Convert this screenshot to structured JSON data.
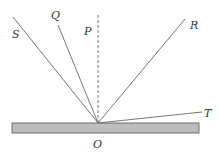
{
  "diagram": {
    "type": "ray-diagram",
    "surface": {
      "x1": 12,
      "y1": 123,
      "x2": 199,
      "y2": 133,
      "fill": "#bdbdbd",
      "stroke": "#555555"
    },
    "origin": {
      "x": 98,
      "y": 123,
      "label": "O",
      "label_x": 98,
      "label_y": 147
    },
    "normal": {
      "label": "P",
      "x": 98,
      "y1": 15,
      "y2": 123,
      "dashed": true,
      "label_x": 88,
      "label_y": 35
    },
    "rays": [
      {
        "label": "S",
        "x_end": 13,
        "y_end": 17,
        "label_x": 16,
        "label_y": 38
      },
      {
        "label": "Q",
        "x_end": 58,
        "y_end": 25,
        "label_x": 55,
        "label_y": 19
      },
      {
        "label": "R",
        "x_end": 185,
        "y_end": 19,
        "label_x": 193,
        "label_y": 29
      },
      {
        "label": "T",
        "x_end": 202,
        "y_end": 112,
        "label_x": 207,
        "label_y": 117
      }
    ],
    "line_color": "#666666"
  },
  "labels": {
    "S": "S",
    "Q": "Q",
    "P": "P",
    "R": "R",
    "T": "T",
    "O": "O"
  }
}
